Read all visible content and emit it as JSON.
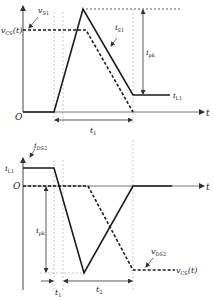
{
  "top_plot": {
    "y_label_vcs": "v",
    "y_label_vcs_sub": "CS",
    "y_label_vcs_arg": "(t)",
    "label_vs1": "v",
    "label_vs1_sub": "S1",
    "label_is1": "i",
    "label_is1_sub": "S1",
    "label_ipk": "i",
    "label_ipk_sub": "pk",
    "label_il1": "i",
    "label_il1_sub": "L1",
    "origin": "O",
    "t_axis": "t",
    "interval_label": "t",
    "interval_label_sub": "1"
  },
  "bottom_plot": {
    "label_ids2": "i",
    "label_ids2_sub": "DS2",
    "y_label_il1": "i",
    "y_label_il1_sub": "L1",
    "origin": "O",
    "t_axis": "t",
    "label_ipk": "i",
    "label_ipk_sub": "pk",
    "label_vds2": "v",
    "label_vds2_sub": "DS2",
    "label_vcs": "v",
    "label_vcs_sub": "CS",
    "label_vcs_arg": "(t)",
    "interval1_label": "t",
    "interval1_label_sub": "1",
    "interval2_label": "t",
    "interval2_label_sub": "2"
  },
  "colors": {
    "line": "#1a1a1a",
    "axis": "#555555",
    "guide": "#bbbbbb"
  }
}
